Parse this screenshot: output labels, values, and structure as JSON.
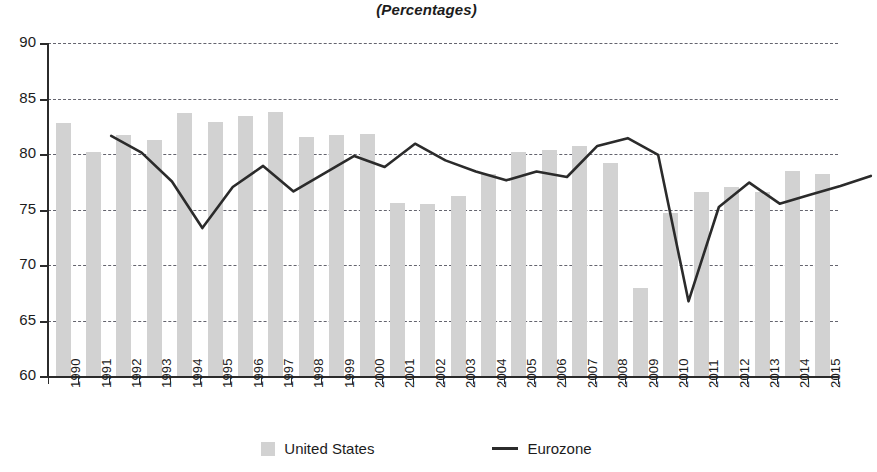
{
  "title": "(Percentages)",
  "legend": {
    "items": [
      {
        "label": "United States",
        "marker": "bar-swatch-icon",
        "color": "#d2d2d2"
      },
      {
        "label": "Eurozone",
        "marker": "line-swatch-icon",
        "color": "#2b2b2b"
      }
    ]
  },
  "axes": {
    "y_ticks": [
      "90",
      "85",
      "80",
      "75",
      "70",
      "65",
      "60"
    ],
    "x_ticks": [
      "1990",
      "1991",
      "1992",
      "1993",
      "1994",
      "1995",
      "1996",
      "1997",
      "1998",
      "1999",
      "2000",
      "2001",
      "2002",
      "2003",
      "2004",
      "2005",
      "2006",
      "2007",
      "2008",
      "2009",
      "2010",
      "2011",
      "2012",
      "2013",
      "2014",
      "2015"
    ]
  },
  "chart_data": {
    "type": "bar",
    "title": "(Percentages)",
    "xlabel": "",
    "ylabel": "",
    "ylim": [
      60,
      90
    ],
    "ytick_step": 5,
    "grid": true,
    "legend_position": "bottom",
    "categories": [
      "1990",
      "1991",
      "1992",
      "1993",
      "1994",
      "1995",
      "1996",
      "1997",
      "1998",
      "1999",
      "2000",
      "2001",
      "2002",
      "2003",
      "2004",
      "2005",
      "2006",
      "2007",
      "2008",
      "2009",
      "2010",
      "2011",
      "2012",
      "2013",
      "2014",
      "2015"
    ],
    "series": [
      {
        "name": "United States",
        "type": "bar",
        "color": "#d2d2d2",
        "values": [
          82.8,
          80.2,
          81.7,
          81.3,
          83.7,
          82.9,
          83.4,
          83.8,
          81.5,
          81.7,
          81.8,
          75.6,
          75.5,
          76.2,
          78.2,
          80.2,
          80.4,
          80.7,
          79.2,
          67.9,
          74.7,
          76.6,
          77.0,
          76.6,
          78.5,
          78.2
        ]
      },
      {
        "name": "Eurozone",
        "type": "line",
        "color": "#2b2b2b",
        "values": [
          85.5,
          84.0,
          81.4,
          77.2,
          80.9,
          82.8,
          80.5,
          82.1,
          83.7,
          82.7,
          84.8,
          83.3,
          82.3,
          81.5,
          82.3,
          81.8,
          84.6,
          85.3,
          83.8,
          70.6,
          79.1,
          81.3,
          79.4,
          80.2,
          81.0,
          81.9
        ]
      }
    ]
  }
}
